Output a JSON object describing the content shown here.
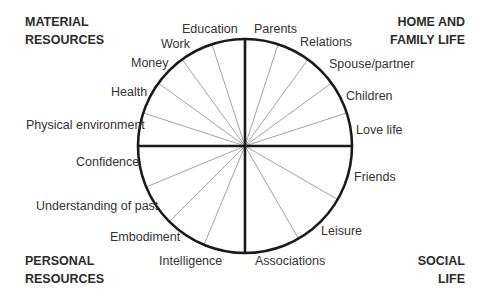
{
  "diagram": {
    "type": "life-wheel",
    "quadrants": [
      {
        "id": "top-left",
        "title_line1": "MATERIAL",
        "title_line2": "RESOURCES",
        "segments": [
          "Education",
          "Work",
          "Money",
          "Health",
          "Physical environment"
        ]
      },
      {
        "id": "top-right",
        "title_line1": "HOME AND",
        "title_line2": "FAMILY LIFE",
        "segments": [
          "Parents",
          "Relations",
          "Spouse/partner",
          "Children",
          "Love life"
        ]
      },
      {
        "id": "bottom-left",
        "title_line1": "PERSONAL",
        "title_line2": "RESOURCES",
        "segments": [
          "Confidence",
          "Understanding of past",
          "Embodiment",
          "Intelligence"
        ]
      },
      {
        "id": "bottom-right",
        "title_line1": "SOCIAL",
        "title_line2": "LIFE",
        "segments": [
          "Friends",
          "Leisure",
          "Associations"
        ]
      }
    ],
    "colors": {
      "outline": "#1a1a1a",
      "spoke": "#8a8a8a",
      "text": "#333333"
    }
  }
}
